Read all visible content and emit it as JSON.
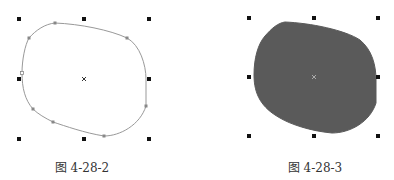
{
  "figures": [
    {
      "caption": "图 4-28-2",
      "state": "outline",
      "fill": "none",
      "stroke": "#999999"
    },
    {
      "caption": "图 4-28-3",
      "state": "filled",
      "fill": "#5a5a5a",
      "stroke": "#5a5a5a"
    }
  ],
  "colors": {
    "handle": "#111111",
    "node": "#888888"
  }
}
